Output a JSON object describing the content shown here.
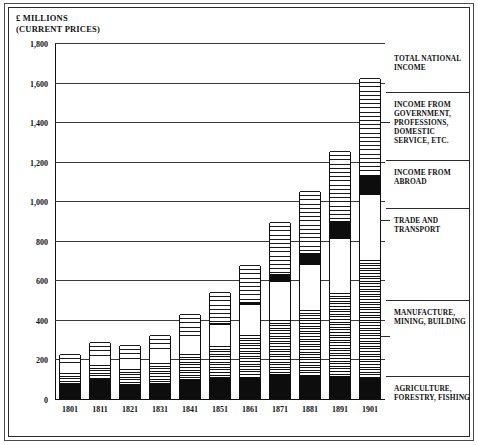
{
  "header": {
    "title": "£ MILLIONS",
    "subtitle": "(CURRENT PRICES)"
  },
  "chart_data": {
    "type": "bar",
    "stacked": true,
    "title": "£ MILLIONS (CURRENT PRICES)",
    "xlabel": "",
    "ylabel": "£ MILLIONS (CURRENT PRICES)",
    "ylim": [
      0,
      1800
    ],
    "ytick_step": 200,
    "grid": true,
    "legend_position": "right",
    "categories": [
      "1801",
      "1811",
      "1821",
      "1831",
      "1841",
      "1851",
      "1861",
      "1871",
      "1881",
      "1891",
      "1901"
    ],
    "ytick_labels": [
      "0",
      "200",
      "400",
      "600",
      "800",
      "1,000",
      "1,200",
      "1,400",
      "1,600",
      "1,800"
    ],
    "ytick_values": [
      0,
      200,
      400,
      600,
      800,
      1000,
      1200,
      1400,
      1600,
      1800
    ],
    "series": [
      {
        "name": "AGRICULTURE, FORESTRY, FISHING",
        "fill": "solid-black",
        "values": [
          75,
          107,
          76,
          80,
          101,
          104,
          110,
          125,
          120,
          115,
          105
        ]
      },
      {
        "name": "MANUFACTURE, MINING, BUILDING",
        "fill": "dense-horizontal-hatch",
        "values": [
          55,
          63,
          77,
          100,
          128,
          165,
          215,
          275,
          330,
          420,
          600
        ]
      },
      {
        "name": "TRADE AND TRANSPORT",
        "fill": "white",
        "values": [
          38,
          45,
          50,
          57,
          75,
          105,
          150,
          190,
          230,
          275,
          325
        ]
      },
      {
        "name": "INCOME FROM ABROAD",
        "fill": "solid-black",
        "values": [
          0,
          0,
          0,
          0,
          0,
          8,
          16,
          40,
          60,
          90,
          105
        ]
      },
      {
        "name": "INCOME FROM GOVERNMENT, PROFESSIONS, DOMESTIC SERVICE, ETC.",
        "fill": "wide-horizontal-hatch",
        "values": [
          62,
          75,
          72,
          88,
          126,
          158,
          189,
          265,
          310,
          355,
          490
        ]
      }
    ],
    "totals": [
      230,
      290,
      275,
      325,
      430,
      540,
      680,
      895,
      1050,
      1255,
      1625
    ],
    "total_label": "TOTAL NATIONAL INCOME"
  },
  "legend": {
    "items": [
      {
        "label": "TOTAL NATIONAL INCOME"
      },
      {
        "label": "INCOME FROM GOVERNMENT, PROFESSIONS, DOMESTIC SERVICE, ETC."
      },
      {
        "label": "INCOME FROM ABROAD"
      },
      {
        "label": "TRADE AND TRANSPORT"
      },
      {
        "label": "MANUFACTURE, MINING, BUILDING"
      },
      {
        "label": "AGRICULTURE, FORESTRY, FISHING"
      }
    ]
  },
  "colors": {
    "ink": "#111111",
    "frame": "#2b2b2b",
    "grid": "#3a3a3a",
    "paper": "#ffffff"
  }
}
